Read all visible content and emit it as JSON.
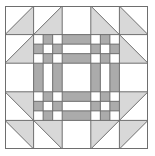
{
  "quilt_block": {
    "grid_size": 5,
    "colors": {
      "background": "#ffffff",
      "triangle_fill": "#d8d8d8",
      "chain_fill": "#ababab",
      "line": "#6e6e6e"
    },
    "triangles": [
      {
        "row": 0,
        "col": 0,
        "fill_corner": "br"
      },
      {
        "row": 0,
        "col": 1,
        "fill_corner": "br"
      },
      {
        "row": 1,
        "col": 0,
        "fill_corner": "br"
      },
      {
        "row": 0,
        "col": 3,
        "fill_corner": "bl"
      },
      {
        "row": 0,
        "col": 4,
        "fill_corner": "bl"
      },
      {
        "row": 1,
        "col": 4,
        "fill_corner": "bl"
      },
      {
        "row": 3,
        "col": 0,
        "fill_corner": "tr"
      },
      {
        "row": 4,
        "col": 0,
        "fill_corner": "tr"
      },
      {
        "row": 4,
        "col": 1,
        "fill_corner": "tr"
      },
      {
        "row": 3,
        "col": 4,
        "fill_corner": "tl"
      },
      {
        "row": 4,
        "col": 3,
        "fill_corner": "tl"
      },
      {
        "row": 4,
        "col": 4,
        "fill_corner": "tl"
      }
    ],
    "chain_corners": [
      {
        "row": 1,
        "col": 1
      },
      {
        "row": 1,
        "col": 3
      },
      {
        "row": 3,
        "col": 1
      },
      {
        "row": 3,
        "col": 3
      }
    ],
    "chain_strips": [
      {
        "row": 1,
        "col": 2,
        "orientation": "horizontal"
      },
      {
        "row": 3,
        "col": 2,
        "orientation": "horizontal"
      },
      {
        "row": 2,
        "col": 1,
        "orientation": "vertical"
      },
      {
        "row": 2,
        "col": 3,
        "orientation": "vertical"
      }
    ]
  }
}
